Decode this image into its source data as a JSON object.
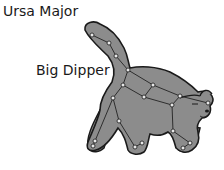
{
  "labels": {
    "title": "Ursa Major",
    "asterism": "Big Dipper"
  },
  "colors": {
    "bear_fill": "#8c8c8c",
    "bear_outline": "#1a1a1a",
    "star_fill": "#e8e8e8",
    "line": "#222222",
    "background": "#ffffff"
  },
  "stars": [
    [
      92,
      35
    ],
    [
      109,
      43
    ],
    [
      116,
      56
    ],
    [
      128,
      70
    ],
    [
      123,
      85
    ],
    [
      153,
      85
    ],
    [
      144,
      97
    ],
    [
      180,
      96
    ],
    [
      208,
      103
    ],
    [
      113,
      98
    ],
    [
      172,
      105
    ],
    [
      119,
      121
    ],
    [
      173,
      131
    ],
    [
      95,
      141
    ],
    [
      93,
      146
    ],
    [
      135,
      147
    ],
    [
      142,
      143
    ],
    [
      190,
      143
    ],
    [
      183,
      148
    ]
  ]
}
